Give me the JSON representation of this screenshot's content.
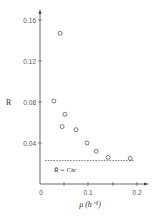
{
  "chart_data": {
    "type": "scatter",
    "title": "",
    "xlabel": "μ (h⁻¹)",
    "ylabel": "R",
    "xlim": [
      0,
      0.22
    ],
    "ylim": [
      0,
      0.17
    ],
    "x_ticks": [
      "0",
      "0.1",
      "0.2"
    ],
    "y_ticks": [
      "0.04",
      "0.08",
      "0.12",
      "0.16"
    ],
    "grid": false,
    "legend": null,
    "series": [
      {
        "name": "R",
        "marker": "open-circle",
        "x": [
          0.042,
          0.029,
          0.052,
          0.046,
          0.075,
          0.098,
          0.117,
          0.142,
          0.188
        ],
        "y": [
          0.147,
          0.081,
          0.068,
          0.056,
          0.053,
          0.04,
          0.032,
          0.026,
          0.025
        ]
      }
    ],
    "reference_line": {
      "y": 0.023,
      "x_start": 0.01,
      "x_end": 0.193,
      "style": "dashed",
      "label": "R̄ = Cte"
    },
    "annotations": [
      {
        "text": "R̄ = Cte",
        "x": 0.06,
        "y": 0.014
      }
    ]
  }
}
